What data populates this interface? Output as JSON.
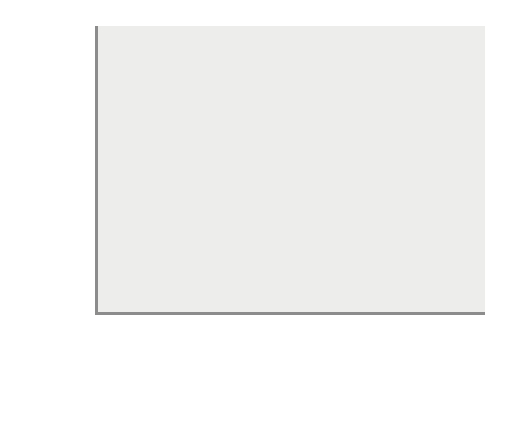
{
  "chart_data": {
    "type": "bar",
    "title": "",
    "subtitle": "",
    "xlabel": "",
    "ylabel": "Number of observations",
    "categories": [
      "Insecure\navoidant\nattachment",
      "Secure\nattachment",
      "Insecure\nresistant\nattachment"
    ],
    "values": [
      49,
      100,
      22
    ],
    "ylim": [
      0,
      100
    ],
    "yticks": [
      0,
      20,
      40,
      60,
      80,
      100
    ],
    "ytick_labels": [
      "0",
      "20",
      "40",
      "60",
      "80",
      "100"
    ],
    "grid": false,
    "legend": null,
    "annotations": []
  },
  "style": {
    "panel_background": "#ededeb",
    "page_background": "#ffffff",
    "bar_fill": "#c6c6c6",
    "bar_border": "#8e8e8e",
    "axis_color": "#8c8c8c",
    "text_color": "#333333"
  }
}
